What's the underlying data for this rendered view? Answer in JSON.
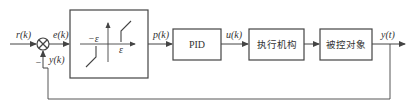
{
  "diagram": {
    "type": "control-loop-block-diagram",
    "signals": {
      "reference": "r(k)",
      "error": "e(k)",
      "feedback": "y(k)",
      "minus_sign": "−",
      "deadzone_output": "p(k)",
      "control": "u(k)",
      "output": "y(t)"
    },
    "deadzone_block": {
      "neg_threshold": "−ε",
      "pos_threshold": "ε"
    },
    "blocks": {
      "pid": "PID",
      "actuator": "执行机构",
      "plant": "被控对象"
    },
    "colors": {
      "line": "#444444",
      "background": "#ffffff"
    }
  }
}
